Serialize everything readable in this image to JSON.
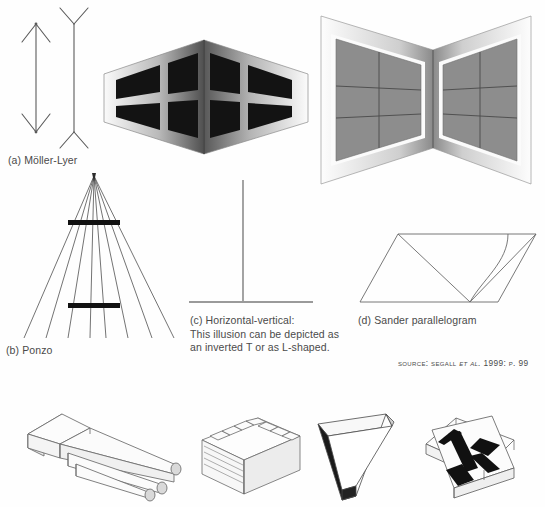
{
  "page": {
    "title": "Visual illusions figure plate",
    "background": "#fefefe",
    "width": 545,
    "height": 507
  },
  "captions": {
    "a": "(a) Möller-Lyer",
    "b": "(b) Ponzo",
    "c": "(c) Horizontal-vertical:\nThis illusion can be depicted as\nan inverted T or as L-shaped.",
    "d": "(d) Sander parallelogram"
  },
  "source": {
    "prefix": "Source:",
    "author": "Segall",
    "etal": "et al.",
    "year": "1999:",
    "page": "p. 99",
    "full_text": "Source: Segall et al. 1999: p. 99"
  },
  "colors": {
    "ink": "#4a4a4a",
    "line": "#555555",
    "bar_dark": "#111111",
    "window_dark": "#151515",
    "window_gray": "#8d8d8d",
    "wall_light": "#f2f2f2",
    "wall_mid": "#9a9a9a",
    "wall_dark": "#6d6d6d",
    "background": "#fefefe"
  },
  "figures": [
    {
      "id": "muller-lyer",
      "name": "Möller-Lyer arrows",
      "label": "(a) Möller-Lyer",
      "elements": [
        {
          "name": "left-shaft-with-inward-fins",
          "orientation": "vertical",
          "fin_direction": "inward"
        },
        {
          "name": "right-shaft-with-outward-fins",
          "orientation": "vertical",
          "fin_direction": "outward"
        }
      ]
    },
    {
      "id": "ponzo",
      "name": "Ponzo converging lines",
      "label": "(b) Ponzo",
      "elements": [
        {
          "name": "converging-line-fan",
          "line_count": 8
        },
        {
          "name": "upper-horizontal-bar",
          "position": "upper"
        },
        {
          "name": "lower-horizontal-bar",
          "position": "lower"
        }
      ]
    },
    {
      "id": "horizontal-vertical",
      "name": "Horizontal-vertical inverted T",
      "label": "(c) Horizontal-vertical",
      "elements": [
        {
          "name": "vertical-stroke"
        },
        {
          "name": "horizontal-baseline"
        }
      ]
    },
    {
      "id": "sander-parallelogram",
      "name": "Sander parallelogram",
      "label": "(d) Sander parallelogram",
      "elements": [
        {
          "name": "parallelogram-outline"
        },
        {
          "name": "long-diagonal"
        },
        {
          "name": "short-diagonal"
        },
        {
          "name": "inner-curve"
        }
      ]
    },
    {
      "id": "outside-corner-windows",
      "name": "Outside building corner with dark windows",
      "elements": [
        {
          "name": "left-wall-panel",
          "window_count": 4
        },
        {
          "name": "right-wall-panel",
          "window_count": 4
        }
      ]
    },
    {
      "id": "inside-corner-windows",
      "name": "Inside room corner with gray windows",
      "elements": [
        {
          "name": "left-wall-panel",
          "window_count": 6
        },
        {
          "name": "right-wall-panel",
          "window_count": 6
        }
      ]
    },
    {
      "id": "impossible-trident",
      "name": "Impossible trident (devil's fork)",
      "elements": [
        {
          "name": "prong-group",
          "prong_count": 3
        }
      ]
    },
    {
      "id": "impossible-staircase",
      "name": "Impossible staircase block",
      "elements": [
        {
          "name": "step-group",
          "step_count": 7
        }
      ]
    },
    {
      "id": "penrose-triangle",
      "name": "Penrose impossible triangle",
      "elements": [
        {
          "name": "triangle-beams",
          "beam_count": 3
        }
      ]
    },
    {
      "id": "impossible-cross",
      "name": "Impossible interlocking cross",
      "elements": [
        {
          "name": "cross-bars",
          "bar_count": 2
        }
      ]
    }
  ]
}
